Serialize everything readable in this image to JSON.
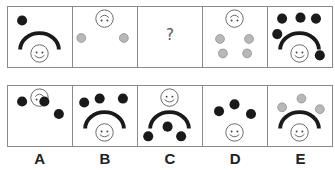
{
  "puzzle": {
    "colors": {
      "black_dot": "#1a1a1a",
      "gray_dot": "#b8b8b8",
      "gray_dot_stroke": "#777777",
      "arc": "#1a1a1a",
      "face_stroke": "#555555",
      "border": "#8a8a8a"
    },
    "question_row": [
      {
        "id": "q1",
        "face": "smile",
        "arc": true,
        "dots": [
          {
            "x": 14,
            "y": 14,
            "c": "black"
          }
        ]
      },
      {
        "id": "q2",
        "face": "frown",
        "arc": false,
        "dots": [
          {
            "x": 8,
            "y": 32,
            "c": "gray"
          },
          {
            "x": 52,
            "y": 32,
            "c": "gray"
          }
        ]
      },
      {
        "id": "q3",
        "missing": true,
        "symbol": "?"
      },
      {
        "id": "q4",
        "face": "frown",
        "arc": false,
        "dots": [
          {
            "x": 17,
            "y": 33,
            "c": "gray"
          },
          {
            "x": 47,
            "y": 33,
            "c": "gray"
          },
          {
            "x": 20,
            "y": 48,
            "c": "gray"
          },
          {
            "x": 45,
            "y": 48,
            "c": "gray"
          }
        ]
      },
      {
        "id": "q5",
        "face": "smile",
        "arc": true,
        "dots": [
          {
            "x": 14,
            "y": 12,
            "c": "black"
          },
          {
            "x": 33,
            "y": 11,
            "c": "black"
          },
          {
            "x": 49,
            "y": 12,
            "c": "black"
          },
          {
            "x": 9,
            "y": 28,
            "c": "black"
          },
          {
            "x": 53,
            "y": 50,
            "c": "black"
          }
        ]
      }
    ],
    "options": [
      {
        "label": "A",
        "face": "frown",
        "arc": false,
        "dots": [
          {
            "x": 14,
            "y": 16,
            "c": "black"
          },
          {
            "x": 37,
            "y": 16,
            "c": "black"
          },
          {
            "x": 52,
            "y": 29,
            "c": "black"
          }
        ]
      },
      {
        "label": "B",
        "face": "smile",
        "arc": true,
        "dots": [
          {
            "x": 11,
            "y": 17,
            "c": "black"
          },
          {
            "x": 27,
            "y": 13,
            "c": "black"
          },
          {
            "x": 51,
            "y": 13,
            "c": "black"
          }
        ]
      },
      {
        "label": "C",
        "face": "smile-top",
        "arc": true,
        "dots": [
          {
            "x": 10,
            "y": 52,
            "c": "black"
          },
          {
            "x": 30,
            "y": 42,
            "c": "black"
          },
          {
            "x": 44,
            "y": 52,
            "c": "black"
          }
        ]
      },
      {
        "label": "D",
        "face": "smile",
        "arc": false,
        "dots": [
          {
            "x": 16,
            "y": 26,
            "c": "black"
          },
          {
            "x": 32,
            "y": 19,
            "c": "black"
          },
          {
            "x": 49,
            "y": 29,
            "c": "black"
          }
        ]
      },
      {
        "label": "E",
        "face": "smile",
        "arc": true,
        "dots": [
          {
            "x": 14,
            "y": 22,
            "c": "gray"
          },
          {
            "x": 34,
            "y": 13,
            "c": "gray"
          },
          {
            "x": 53,
            "y": 24,
            "c": "gray"
          }
        ]
      }
    ]
  }
}
